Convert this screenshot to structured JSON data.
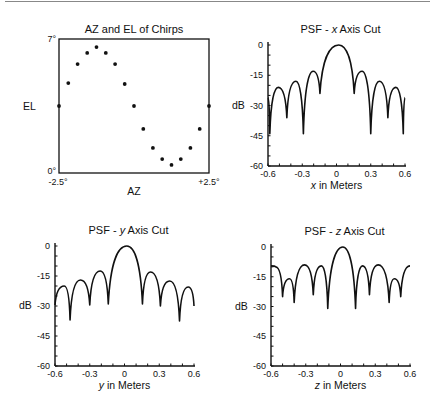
{
  "chart_data": [
    {
      "id": "az-el",
      "type": "scatter",
      "title": "AZ and EL of Chirps",
      "xlabel": "AZ",
      "ylabel": "EL",
      "xlim": [
        -2.5,
        2.5
      ],
      "ylim": [
        0,
        7
      ],
      "x_tick_labels": [
        "-2.5°",
        "+2.5°"
      ],
      "y_tick_labels": [
        "0°",
        "7°"
      ],
      "frame": "box",
      "grid": false,
      "x": [
        -2.5,
        -2.19,
        -1.88,
        -1.56,
        -1.25,
        -0.94,
        -0.63,
        -0.31,
        0.0,
        0.31,
        0.63,
        0.94,
        1.25,
        1.56,
        1.88,
        2.19,
        2.5
      ],
      "y": [
        3.5,
        4.7,
        5.69,
        6.27,
        6.58,
        6.27,
        5.69,
        4.65,
        3.5,
        2.3,
        1.31,
        0.73,
        0.42,
        0.73,
        1.31,
        2.3,
        3.5
      ],
      "frame_px": {
        "left": 59,
        "top": 39,
        "right": 209,
        "bottom": 173
      }
    },
    {
      "id": "psf-x",
      "type": "line",
      "title_prefix": "PSF - ",
      "title_var": "x",
      "title_suffix": " Axis Cut",
      "xlabel_var": "x",
      "xlabel_suffix": " in Meters",
      "ylabel": "dB",
      "xlim": [
        -0.6,
        0.6
      ],
      "ylim": [
        -60,
        0
      ],
      "x_ticks": [
        -0.6,
        -0.3,
        0,
        0.3,
        0.6
      ],
      "x_tick_labels": [
        "-0.6",
        "-0.3",
        "0",
        "0.3",
        "0.6"
      ],
      "y_ticks": [
        0,
        -15,
        -30,
        -45,
        -60
      ],
      "y_tick_labels": [
        "0",
        "-15",
        "-30",
        "-45",
        "-60"
      ],
      "x_minor_step": 0.1,
      "y_minor_step": 5,
      "grid": false,
      "x": [
        -0.6,
        -0.584,
        -0.51,
        -0.435,
        -0.355,
        -0.29,
        -0.205,
        -0.145,
        0.02,
        0.155,
        0.225,
        0.3,
        0.375,
        0.45,
        0.52,
        0.585,
        0.6
      ],
      "y": [
        -26,
        -44,
        -21,
        -36,
        -18,
        -44,
        -13,
        -24,
        0,
        -24,
        -13,
        -44,
        -18,
        -36,
        -21,
        -44,
        -26
      ],
      "frame_px": {
        "left": 268,
        "top": 45,
        "right": 405,
        "bottom": 166
      }
    },
    {
      "id": "psf-y",
      "type": "line",
      "title_prefix": "PSF - ",
      "title_var": "y",
      "title_suffix": " Axis Cut",
      "xlabel_var": "y",
      "xlabel_suffix": " in Meters",
      "ylabel": "dB",
      "xlim": [
        -0.6,
        0.6
      ],
      "ylim": [
        -60,
        0
      ],
      "x_ticks": [
        -0.6,
        -0.3,
        0,
        0.3,
        0.6
      ],
      "x_tick_labels": [
        "-0.6",
        "-0.3",
        "0",
        "0.3",
        "0.6"
      ],
      "y_ticks": [
        0,
        -15,
        -30,
        -45,
        -60
      ],
      "y_tick_labels": [
        "0",
        "-15",
        "-30",
        "-45",
        "-60"
      ],
      "x_minor_step": 0.1,
      "y_minor_step": 5,
      "grid": false,
      "x": [
        -0.6,
        -0.52,
        -0.47,
        -0.38,
        -0.3,
        -0.21,
        -0.14,
        0.02,
        0.155,
        0.225,
        0.31,
        0.39,
        0.475,
        0.55,
        0.6
      ],
      "y": [
        -29.5,
        -20,
        -37,
        -17,
        -29.5,
        -12.5,
        -29,
        0,
        -29,
        -13,
        -30,
        -17.5,
        -37.5,
        -20.5,
        -30
      ],
      "frame_px": {
        "left": 55,
        "top": 246,
        "right": 194,
        "bottom": 366
      }
    },
    {
      "id": "psf-z",
      "type": "line",
      "title_prefix": "PSF - ",
      "title_var": "z",
      "title_suffix": " Axis Cut",
      "xlabel_var": "z",
      "xlabel_suffix": " in Meters",
      "ylabel": "dB",
      "xlim": [
        -0.6,
        0.6
      ],
      "ylim": [
        -60,
        0
      ],
      "x_ticks": [
        -0.6,
        -0.3,
        0,
        0.3,
        0.6
      ],
      "x_tick_labels": [
        "-0.6",
        "-0.3",
        "0",
        "0.3",
        "0.6"
      ],
      "y_ticks": [
        0,
        -15,
        -30,
        -45,
        -60
      ],
      "y_tick_labels": [
        "0",
        "-15",
        "-30",
        "-45",
        "-60"
      ],
      "x_minor_step": 0.1,
      "y_minor_step": 5,
      "grid": false,
      "x": [
        -0.6,
        -0.56,
        -0.5,
        -0.44,
        -0.4,
        -0.31,
        -0.235,
        -0.165,
        -0.11,
        0.02,
        0.13,
        0.19,
        0.25,
        0.325,
        0.42,
        0.465,
        0.52,
        0.6
      ],
      "y": [
        -9.5,
        -10,
        -25,
        -16,
        -28,
        -9,
        -24,
        -9.5,
        -31,
        0,
        -31,
        -9.5,
        -24,
        -9,
        -28,
        -16,
        -25,
        -9.5
      ],
      "frame_px": {
        "left": 271,
        "top": 247,
        "right": 410,
        "bottom": 366
      }
    }
  ],
  "style": {
    "ink": "#111111",
    "background": "#ffffff",
    "rule": "#888888"
  }
}
